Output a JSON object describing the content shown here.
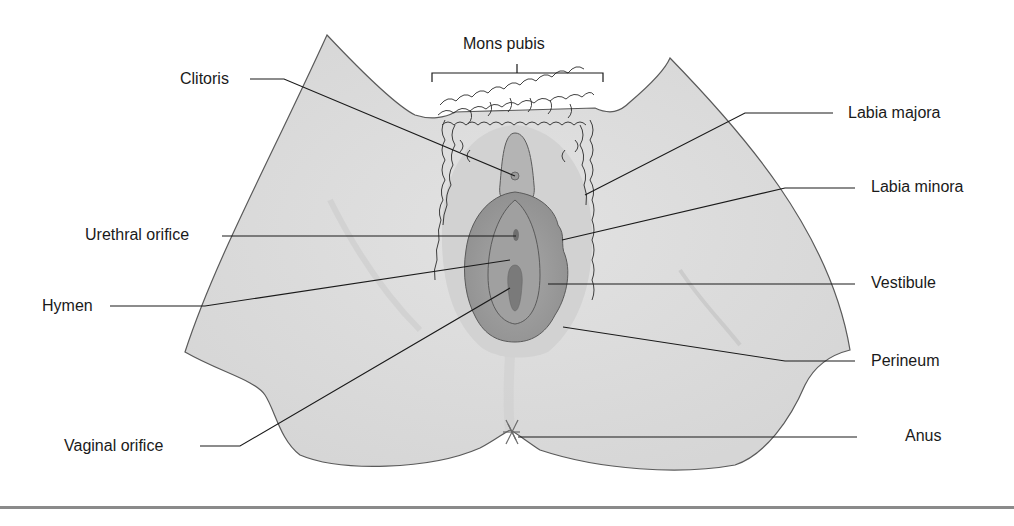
{
  "diagram": {
    "colors": {
      "skin": "#dcdcdc",
      "skin_outline": "#5a5a5a",
      "labia_majora": "#b9b9b9",
      "labia_minora": "#9e9e9e",
      "vestibule": "#8c8c8c",
      "orifice": "#6e6e6e",
      "hair": "#222222",
      "leader_line": "#1a1a1a",
      "bottom_rule": "#8a8a8a"
    },
    "labels": {
      "mons_pubis": "Mons pubis",
      "clitoris": "Clitoris",
      "labia_majora": "Labia majora",
      "labia_minora": "Labia minora",
      "urethral_orifice": "Urethral orifice",
      "hymen": "Hymen",
      "vestibule": "Vestibule",
      "perineum": "Perineum",
      "vaginal_orifice": "Vaginal orifice",
      "anus": "Anus"
    }
  }
}
